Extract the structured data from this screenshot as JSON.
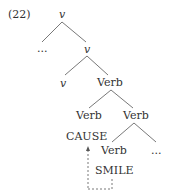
{
  "example_number": "(22)",
  "nodes": {
    "root": "v",
    "left_dots": "...",
    "v_bar": "v",
    "v_head": "v",
    "verb1": "Verb",
    "verb_left": "Verb",
    "verb_right": "Verb",
    "cause": "CAUSE",
    "verb_low": "Verb",
    "right_dots": "...",
    "smile": "SMILE"
  }
}
